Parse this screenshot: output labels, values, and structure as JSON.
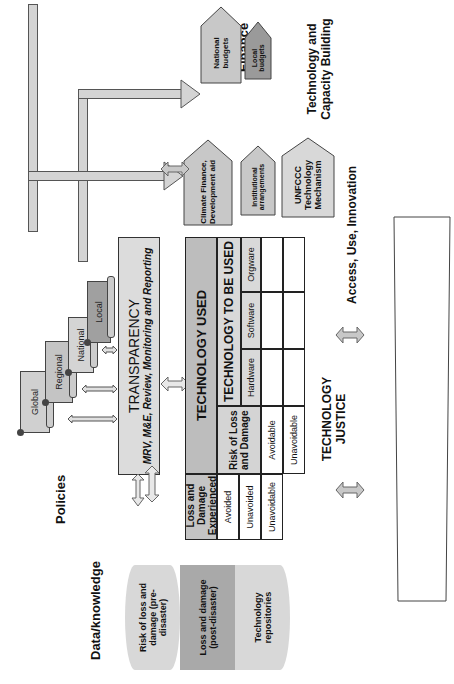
{
  "sections": {
    "finance": "Finance",
    "technology_capacity": "Technology and Capacity Building",
    "access": "Access, Use, Innovation",
    "policies": "Policies",
    "data_knowledge": "Data/knowledge",
    "communities": "Poor and vulnerable communities",
    "technology_justice": "TECHNOLOGY JUSTICE"
  },
  "finance_boxes": {
    "national_budgets": "National budgets",
    "local_budgets": "Local budgets",
    "climate_finance": "Climate Finance, Development aid",
    "institutional": "Institutional arrangements",
    "unfccc": "UNFCCC Technology Mechanism"
  },
  "policy_levels": [
    "Global",
    "Regional",
    "National",
    "Local"
  ],
  "transparency": {
    "title": "TRANSPARENCY",
    "subtitle": "MRV, M&E, Review, Monitoring and Reporting"
  },
  "data_cylinder": [
    "Risk of loss and damage (pre-disaster)",
    "Loss and damage (post-disaster)",
    "Technology repositories"
  ],
  "table": {
    "loss_experienced_header": "Loss and Damage Experienced",
    "loss_experienced_rows": [
      "Avoided",
      "Unavoided",
      "Unavoidable"
    ],
    "technology_used_header": "TECHNOLOGY USED",
    "risk_header": "Risk of Loss and Damage",
    "risk_rows": [
      "Avoidable",
      "Unavoidable"
    ],
    "technology_to_be_used_header": "TECHNOLOGY TO BE USED",
    "tech_columns": [
      "Hardware",
      "Software",
      "Orgware"
    ]
  },
  "colors": {
    "light_gray": "#d9d9d9",
    "mid_gray": "#bfbfbf",
    "dark_gray": "#9a9a9a",
    "border": "#333333"
  }
}
